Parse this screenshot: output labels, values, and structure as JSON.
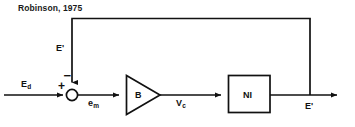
{
  "figure": {
    "caption": "Robinson, 1975",
    "type": "control-system-block-diagram"
  },
  "labels": {
    "input": "E",
    "input_sub": "d",
    "feedback": "E'",
    "error": "e",
    "error_sub": "m",
    "amplifier_output": "V",
    "amplifier_output_sub": "c",
    "output": "E'",
    "plus_sign": "+",
    "minus_sign": "−"
  },
  "blocks": {
    "amplifier": {
      "label": "B",
      "shape": "triangle"
    },
    "plant": {
      "label": "NI",
      "shape": "rectangle"
    },
    "summing_junction": {
      "shape": "circle"
    }
  },
  "colors": {
    "line": "#111111",
    "text": "#111111",
    "background": "#ffffff"
  }
}
